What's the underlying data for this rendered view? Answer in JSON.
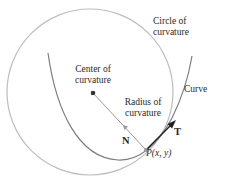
{
  "diagram": {
    "labels": {
      "circle_of_curvature_line1": "Circle of",
      "circle_of_curvature_line2": "curvature",
      "center_of_curvature_line1": "Center of",
      "center_of_curvature_line2": "curvature",
      "radius_of_curvature_line1": "Radius of",
      "radius_of_curvature_line2": "curvature",
      "curve": "Curve",
      "tangent_vector": "T",
      "normal_vector": "N",
      "point": "P(x, y)"
    },
    "colors": {
      "circle": "#b8b8b8",
      "curve": "#7a7a7a",
      "radius": "#9a9a9a",
      "tangent": "#222222",
      "text": "#2a2a2a"
    }
  }
}
